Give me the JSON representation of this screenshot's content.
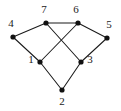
{
  "figure": {
    "kind": "undirected-graph-drawing",
    "width": 121,
    "height": 111,
    "background_color": "#ffffff"
  },
  "style": {
    "edge_color": "#1a1a1a",
    "edge_width": 1.05,
    "highlight_edge_color": "#8c8c8c",
    "highlight_edge_width": 2.1,
    "vertex_color": "#111111",
    "vertex_radius": 2.6,
    "label_color": "#1a1a1a",
    "label_font_size": 11
  },
  "graph": {
    "vertex_count": 7,
    "edge_count": 9,
    "vertices": [
      {
        "id": "1",
        "label": "1",
        "x": 40,
        "y": 62,
        "label_x": 31,
        "label_y": 60
      },
      {
        "id": "2",
        "label": "2",
        "x": 62,
        "y": 90,
        "label_x": 62,
        "label_y": 102
      },
      {
        "id": "3",
        "label": "3",
        "x": 81,
        "y": 62,
        "label_x": 90,
        "label_y": 60
      },
      {
        "id": "4",
        "label": "4",
        "x": 13,
        "y": 37,
        "label_x": 11,
        "label_y": 24
      },
      {
        "id": "5",
        "label": "5",
        "x": 107,
        "y": 38,
        "label_x": 109,
        "label_y": 25
      },
      {
        "id": "6",
        "label": "6",
        "x": 78,
        "y": 23,
        "label_x": 76,
        "label_y": 10
      },
      {
        "id": "7",
        "label": "7",
        "x": 46,
        "y": 23,
        "label_x": 44,
        "label_y": 10
      }
    ],
    "edges": [
      {
        "source": "7",
        "target": "6",
        "x1": 46,
        "y1": 23,
        "x2": 78,
        "y2": 23,
        "highlighted": true
      },
      {
        "source": "4",
        "target": "7",
        "x1": 13,
        "y1": 37,
        "x2": 46,
        "y2": 23,
        "highlighted": false
      },
      {
        "source": "4",
        "target": "1",
        "x1": 13,
        "y1": 37,
        "x2": 40,
        "y2": 62,
        "highlighted": false
      },
      {
        "source": "6",
        "target": "5",
        "x1": 78,
        "y1": 23,
        "x2": 107,
        "y2": 38,
        "highlighted": false
      },
      {
        "source": "5",
        "target": "3",
        "x1": 107,
        "y1": 38,
        "x2": 81,
        "y2": 62,
        "highlighted": false
      },
      {
        "source": "7",
        "target": "3",
        "x1": 46,
        "y1": 23,
        "x2": 81,
        "y2": 62,
        "highlighted": false
      },
      {
        "source": "6",
        "target": "1",
        "x1": 78,
        "y1": 23,
        "x2": 40,
        "y2": 62,
        "highlighted": false
      },
      {
        "source": "1",
        "target": "2",
        "x1": 40,
        "y1": 62,
        "x2": 62,
        "y2": 90,
        "highlighted": false
      },
      {
        "source": "3",
        "target": "2",
        "x1": 81,
        "y1": 62,
        "x2": 62,
        "y2": 90,
        "highlighted": false
      }
    ]
  }
}
